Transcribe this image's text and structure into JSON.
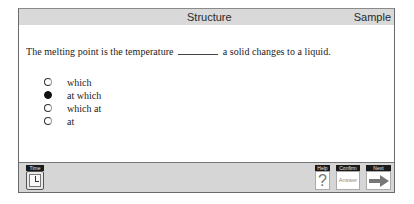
{
  "header": {
    "section": "Structure",
    "mode": "Sample"
  },
  "question": {
    "before_blank": "The melting point is the temperature",
    "after_blank": "a solid changes to a liquid."
  },
  "options": [
    {
      "label": "which",
      "selected": false
    },
    {
      "label": "at which",
      "selected": true
    },
    {
      "label": "which at",
      "selected": false
    },
    {
      "label": "at",
      "selected": false
    }
  ],
  "footer": {
    "time_label": "Time",
    "help_label": "Help",
    "help_glyph": "?",
    "confirm_label": "Confirm",
    "confirm_button_text": "Answer",
    "next_label": "Next"
  }
}
